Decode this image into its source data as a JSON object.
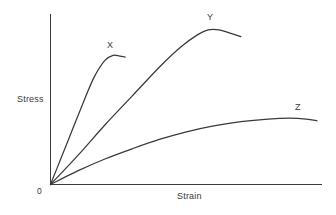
{
  "chart_data": {
    "type": "line",
    "title": "",
    "subtitle": "",
    "xlabel": "Strain",
    "ylabel": "Stress",
    "origin_label": "0",
    "grid": false,
    "legend": "inline-end-labels",
    "axis_color": "#3c3c3c",
    "line_color": "#3a3a3a",
    "background_color": "#ffffff",
    "xlim": [
      0,
      100
    ],
    "ylim": [
      0,
      100
    ],
    "axes_ticks": {
      "x": [],
      "y": []
    },
    "annotations": [
      {
        "text": "X",
        "x": 21,
        "y": 81
      },
      {
        "text": "Y",
        "x": 59,
        "y": 96
      },
      {
        "text": "Z",
        "x": 90,
        "y": 45
      }
    ],
    "series": [
      {
        "name": "X",
        "label": "X",
        "description": "brittle-high-modulus: steep linear rise, short plastic hook, early fracture",
        "x": [
          0,
          4,
          8,
          12,
          16,
          20,
          23,
          25.5,
          27.5
        ],
        "y": [
          0,
          16,
          32,
          48,
          63,
          73,
          76,
          75.5,
          75
        ]
      },
      {
        "name": "Y",
        "label": "Y",
        "description": "ductile-high-strength: long linear region, broad peak, slight necking drop",
        "x": [
          0,
          10,
          20,
          30,
          40,
          48,
          54,
          58,
          62,
          66,
          70
        ],
        "y": [
          0,
          17,
          35,
          52,
          69,
          81,
          88,
          91,
          91,
          89,
          87
        ]
      },
      {
        "name": "Z",
        "label": "Z",
        "description": "low-modulus ductile: shallow slope, gradual curvature, broad flat maximum",
        "x": [
          0,
          10,
          20,
          30,
          40,
          50,
          60,
          70,
          80,
          88,
          94,
          98
        ],
        "y": [
          0,
          8,
          15,
          21,
          26.5,
          31,
          34.5,
          37,
          38.5,
          39,
          38.5,
          37.5
        ]
      }
    ]
  },
  "chart": {
    "ylabel": "Stress",
    "xlabel": "Strain",
    "origin_label": "0",
    "labels": {
      "x": "X",
      "y": "Y",
      "z": "Z"
    }
  }
}
